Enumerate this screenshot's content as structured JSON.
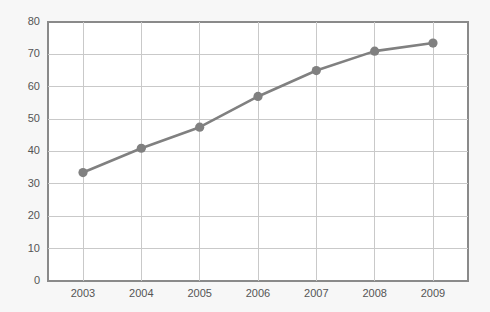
{
  "chart_data": {
    "type": "line",
    "title": "",
    "subtitle": "",
    "xlabel": "",
    "ylabel": "",
    "categories": [
      "2003",
      "2004",
      "2005",
      "2006",
      "2007",
      "2008",
      "2009"
    ],
    "values": [
      33.5,
      41,
      47.5,
      57,
      65,
      71,
      73.5
    ],
    "series": [
      {
        "name": "",
        "values": [
          33.5,
          41,
          47.5,
          57,
          65,
          71,
          73.5
        ]
      }
    ],
    "xlim": [
      2002.4,
      2009.6
    ],
    "ylim": [
      0,
      80
    ],
    "yticks": [
      0,
      10,
      20,
      30,
      40,
      50,
      60,
      70,
      80
    ],
    "ytick_labels": [
      "0",
      "10",
      "20",
      "30",
      "40",
      "50",
      "60",
      "70",
      "80"
    ],
    "xticks": [
      2003,
      2004,
      2005,
      2006,
      2007,
      2008,
      2009
    ],
    "xtick_labels": [
      "2003",
      "2004",
      "2005",
      "2006",
      "2007",
      "2008",
      "2009"
    ],
    "grid": true,
    "grid_axes": "both",
    "legend": false,
    "legend_position": "none",
    "marker": "circle",
    "colors": {
      "series": "#808080",
      "grid": "#c9c9c9",
      "border": "#8a8a8a",
      "plot_background": "#ffffff",
      "figure_background": "#f7f7f7",
      "tick_label": "#555555"
    }
  },
  "layout": {
    "plot_left": 48,
    "plot_right": 468,
    "plot_top": 22,
    "plot_bottom": 281,
    "marker_radius": 4.6
  }
}
